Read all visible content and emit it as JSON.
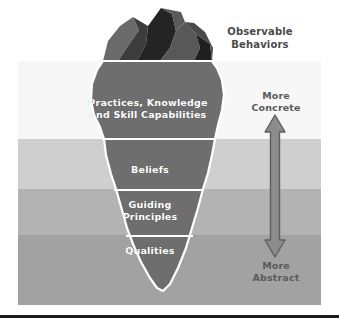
{
  "diagram": {
    "title_text": "Observable Behaviors",
    "observable": {
      "line1": "Observable",
      "line2": "Behaviors"
    },
    "iceberg_layers": [
      {
        "key": "practices",
        "line1": "Practices, Knowledge",
        "line2": "and Skill Capabilities"
      },
      {
        "key": "beliefs",
        "line1": "Beliefs",
        "line2": ""
      },
      {
        "key": "guiding",
        "line1": "Guiding",
        "line2": "Principles"
      },
      {
        "key": "qualities",
        "line1": "Qualities",
        "line2": ""
      }
    ],
    "axis": {
      "top": {
        "line1": "More",
        "line2": "Concrete"
      },
      "bottom": {
        "line1": "More",
        "line2": "Abstract"
      }
    },
    "colors": {
      "band_0": "#f7f7f7",
      "band_1": "#cfcfcf",
      "band_2": "#b3b3b3",
      "band_3": "#a2a2a2",
      "iceberg_body": "#6e6e6e",
      "iceberg_outline": "#ffffff",
      "tip_dark": "#2a2a2a",
      "tip_mid": "#4f4f4f",
      "tip_light": "#6a6a6a",
      "arrow_fill": "#8c8c8c",
      "arrow_stroke": "#585858",
      "text_dark": "#4a4a4a",
      "text_axis": "#5a5a5a",
      "label_text": "#ffffff",
      "rule": "#1b1b1b"
    }
  }
}
